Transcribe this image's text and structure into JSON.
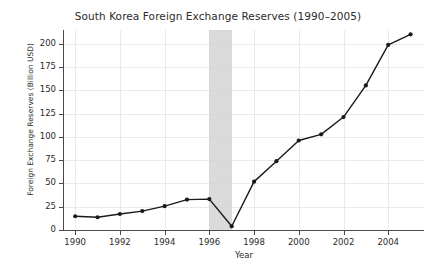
{
  "chart_data": {
    "type": "line",
    "title": "South Korea Foreign Exchange Reserves (1990–2005)",
    "xlabel": "Year",
    "ylabel": "Foreign Exchange Reserves (Billion USD)",
    "x": [
      1990,
      1991,
      1992,
      1993,
      1994,
      1995,
      1996,
      1997,
      1998,
      1999,
      2000,
      2001,
      2002,
      2003,
      2004,
      2005
    ],
    "values": [
      14.8,
      13.7,
      17.2,
      20.3,
      25.6,
      32.7,
      33.2,
      4.0,
      52.0,
      74.0,
      96.2,
      102.8,
      121.4,
      155.4,
      199.0,
      210.4
    ],
    "series": [
      {
        "name": "Foreign Exchange Reserves",
        "values": [
          14.8,
          13.7,
          17.2,
          20.3,
          25.6,
          32.7,
          33.2,
          4.0,
          52.0,
          74.0,
          96.2,
          102.8,
          121.4,
          155.4,
          199.0,
          210.4
        ]
      }
    ],
    "xlim": [
      1989.5,
      2005.6
    ],
    "ylim": [
      0,
      215
    ],
    "ytick_values": [
      0,
      25,
      50,
      75,
      100,
      125,
      150,
      175,
      200
    ],
    "ytick_labels": [
      "0",
      "25",
      "50",
      "75",
      "100",
      "125",
      "150",
      "175",
      "200"
    ],
    "xtick_values": [
      1990,
      1992,
      1994,
      1996,
      1998,
      2000,
      2002,
      2004
    ],
    "xtick_labels": [
      "1990",
      "1992",
      "1994",
      "1996",
      "1998",
      "2000",
      "2002",
      "2004"
    ],
    "grid": true,
    "legend": false,
    "line_color": "#1a1a1a",
    "marker": "circle",
    "marker_color": "#1a1a1a",
    "grid_color": "#e9e9e9",
    "annotations": [
      {
        "type": "vspan",
        "name": "asian-financial-crisis-band",
        "x_start": 1996,
        "x_end": 1997,
        "color": "#d4d4d4"
      }
    ]
  }
}
